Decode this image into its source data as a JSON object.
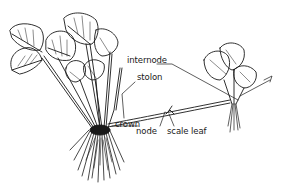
{
  "diagram": {
    "labels": {
      "internode": "internode",
      "stolon": "stolon",
      "node": "node",
      "scale_leaf": "scale leaf",
      "crown": "crown"
    },
    "colors": {
      "ink": "#1a1a1a",
      "background": "#ffffff"
    }
  }
}
